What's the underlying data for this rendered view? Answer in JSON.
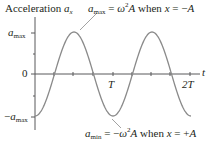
{
  "chart_data": {
    "type": "line",
    "xlabel": "t",
    "ylabel": "Acceleration a_x",
    "function": "a_x = -a_max * cos(2*pi*t/T)",
    "x": [
      0,
      0.125,
      0.25,
      0.375,
      0.5,
      0.625,
      0.75,
      0.875,
      1.0,
      1.125,
      1.25,
      1.375,
      1.5,
      1.625,
      1.75,
      1.875,
      2.0
    ],
    "x_units": "T",
    "series": [
      {
        "name": "a_x",
        "values": [
          -1,
          -0.707,
          0,
          0.707,
          1,
          0.707,
          0,
          -0.707,
          -1,
          -0.707,
          0,
          0.707,
          1,
          0.707,
          0,
          -0.707,
          -1
        ],
        "units": "a_max"
      }
    ],
    "xlim": [
      0,
      2.1
    ],
    "ylim": [
      -1.2,
      1.4
    ],
    "x_ticks": [
      0.25,
      0.5,
      0.75,
      1.0,
      1.25,
      1.5,
      1.75,
      2.0
    ],
    "x_tick_labels": {
      "1.0": "T",
      "2.0": "2T"
    },
    "y_tick_labels": [
      "a_max",
      "0",
      "-a_max"
    ],
    "grid": false,
    "legend": null,
    "line_color": "#8a8a8a",
    "annotations": [
      {
        "text": "a_max = ω²A when x = −A",
        "points_to": "maximum at t = T/2"
      },
      {
        "text": "a_min = −ω²A when x = +A",
        "points_to": "minimum at t = T"
      }
    ]
  },
  "labels": {
    "axis_title_word": "Acceleration ",
    "axis_title_var": "a",
    "axis_title_sub": "x",
    "t_axis": "t",
    "ytick_max_var": "a",
    "ytick_max_sub": "max",
    "ytick_zero": "0",
    "ytick_min_sign": "−",
    "ytick_min_var": "a",
    "ytick_min_sub": "max",
    "xtick_T": "T",
    "xtick_2T": "2T",
    "top_note": {
      "var": "a",
      "sub": "max",
      "eq1": " = ",
      "omega": "ω",
      "sup": "2",
      "A": "A",
      "when": " when ",
      "x": "x",
      "eq2": " = −",
      "rhs": "A"
    },
    "bottom_note": {
      "var": "a",
      "sub": "min",
      "eq1": " = −",
      "omega": "ω",
      "sup": "2",
      "A": "A",
      "when": " when ",
      "x": "x",
      "eq2": " = +",
      "rhs": "A"
    }
  }
}
